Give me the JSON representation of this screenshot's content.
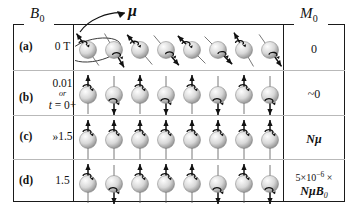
{
  "figure": {
    "headers": {
      "field": "B",
      "field_sub": "0",
      "magnetization": "M",
      "magnetization_sub": "0"
    },
    "annotation": {
      "mu": "μ"
    },
    "rows": [
      {
        "tag": "(a)",
        "field_lines": [
          "0 T"
        ],
        "field_note": "",
        "magnetization": "0",
        "magnetization_line2": "",
        "spin_state": "random",
        "spin_count": 8,
        "has_precession_ellipse": true,
        "spin_angles": [
          -35,
          150,
          -40,
          140,
          -45,
          135,
          -30,
          145
        ]
      },
      {
        "tag": "(b)",
        "field_lines": [
          "0.01",
          "or",
          "t = 0+"
        ],
        "field_note": "or",
        "magnetization": "~0",
        "magnetization_line2": "",
        "spin_state": "alternating",
        "spin_count": 8,
        "has_precession_ellipse": false,
        "spin_angles": [
          0,
          180,
          0,
          180,
          0,
          180,
          0,
          180
        ]
      },
      {
        "tag": "(c)",
        "field_lines": [
          "»1.5"
        ],
        "field_note": "",
        "magnetization": "Nμ",
        "magnetization_line2": "",
        "spin_state": "aligned",
        "spin_count": 8,
        "has_precession_ellipse": false,
        "spin_angles": [
          0,
          0,
          0,
          0,
          0,
          0,
          0,
          0
        ]
      },
      {
        "tag": "(d)",
        "field_lines": [
          "1.5"
        ],
        "field_note": "",
        "magnetization": "5×10−6 ×",
        "magnetization_line2": "NμB0",
        "spin_state": "slight-excess",
        "spin_count": 8,
        "has_precession_ellipse": false,
        "spin_angles": [
          0,
          180,
          0,
          0,
          0,
          180,
          0,
          180
        ]
      }
    ],
    "colors": {
      "border": "#1a1a1a",
      "divider": "#b9b9b9",
      "sphere_light": "#f2f2f2",
      "sphere_dark": "#8d8d8d",
      "arrow": "#111111"
    }
  }
}
